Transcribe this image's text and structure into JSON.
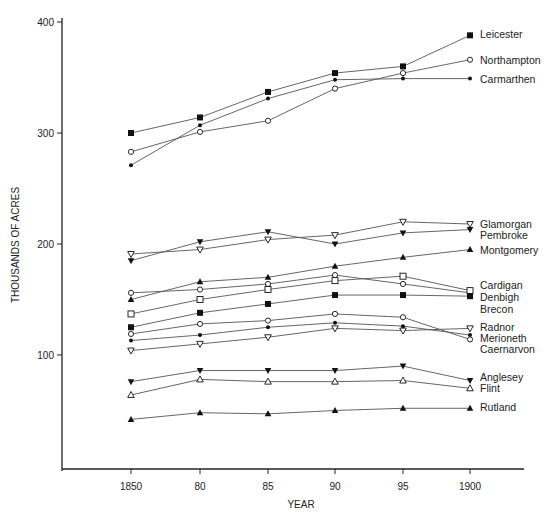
{
  "chart_data": {
    "type": "line",
    "title": "",
    "xlabel": "YEAR",
    "ylabel": "THOUSANDS OF ACRES",
    "x": [
      1850,
      1880,
      1885,
      1890,
      1895,
      1900
    ],
    "x_tick_labels": [
      "1850",
      "80",
      "85",
      "90",
      "95",
      "1900"
    ],
    "y_ticks": [
      100,
      200,
      300,
      400
    ],
    "ylim": [
      0,
      410
    ],
    "grid": false,
    "legend_position": "direct labels at right end of lines",
    "series": [
      {
        "name": "Leicester",
        "marker": "square-filled",
        "values": [
          300,
          314,
          337,
          354,
          360,
          388
        ]
      },
      {
        "name": "Northampton",
        "marker": "circle-open",
        "values": [
          283,
          301,
          311,
          340,
          354,
          366
        ]
      },
      {
        "name": "Carmarthen",
        "marker": "dot-filled",
        "values": [
          271,
          307,
          331,
          348,
          349,
          349
        ]
      },
      {
        "name": "Glamorgan",
        "marker": "tri-down-open",
        "values": [
          191,
          195,
          204,
          208,
          220,
          218
        ]
      },
      {
        "name": "Pembroke",
        "marker": "tri-down-filled",
        "values": [
          185,
          202,
          211,
          200,
          210,
          213
        ]
      },
      {
        "name": "Montgomery",
        "marker": "tri-up-filled",
        "values": [
          150,
          166,
          170,
          180,
          188,
          195
        ]
      },
      {
        "name": "Cardigan",
        "marker": "circle-open",
        "values": [
          156,
          159,
          164,
          172,
          164,
          156
        ]
      },
      {
        "name": "Denbigh",
        "marker": "square-open",
        "values": [
          137,
          150,
          159,
          167,
          171,
          158
        ]
      },
      {
        "name": "Brecon",
        "marker": "square-filled",
        "values": [
          125,
          138,
          146,
          154,
          154,
          153
        ]
      },
      {
        "name": "Radnor",
        "marker": "tri-down-open",
        "values": [
          104,
          110,
          116,
          124,
          122,
          124
        ]
      },
      {
        "name": "Merioneth",
        "marker": "dot-filled",
        "values": [
          113,
          118,
          125,
          129,
          126,
          118
        ]
      },
      {
        "name": "Caernarvon",
        "marker": "circle-open",
        "values": [
          119,
          128,
          131,
          137,
          134,
          114
        ]
      },
      {
        "name": "Anglesey",
        "marker": "tri-down-filled",
        "values": [
          76,
          86,
          86,
          86,
          90,
          77
        ]
      },
      {
        "name": "Flint",
        "marker": "tri-up-open",
        "values": [
          64,
          78,
          76,
          76,
          77,
          70
        ]
      },
      {
        "name": "Rutland",
        "marker": "tri-up-filled",
        "values": [
          42,
          48,
          47,
          50,
          52,
          52
        ]
      }
    ],
    "label_positions": {
      "Leicester": 389,
      "Northampton": 366,
      "Carmarthen": 349,
      "Glamorgan": 218,
      "Pembroke": 208,
      "Montgomery": 195,
      "Cardigan": 163,
      "Denbigh": 152,
      "Brecon": 141,
      "Radnor": 125,
      "Merioneth": 115,
      "Caernarvon": 105,
      "Anglesey": 80,
      "Flint": 70,
      "Rutland": 53
    }
  },
  "colors": {
    "line": "#555555",
    "marker": "#111111",
    "axis": "#222222",
    "text": "#222222"
  }
}
